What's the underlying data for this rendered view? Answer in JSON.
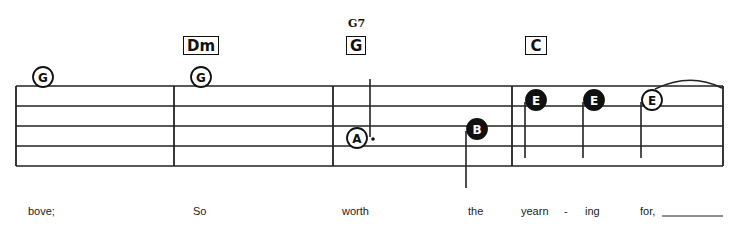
{
  "staff": {
    "line_ys": [
      86,
      106,
      126,
      146,
      166
    ],
    "x_start": 16,
    "x_end": 723,
    "barlines": [
      16,
      174,
      333,
      512,
      723
    ]
  },
  "chords": [
    {
      "label": "Dm",
      "x": 183,
      "y": 36,
      "w": 36
    },
    {
      "label": "G",
      "x": 346,
      "y": 36,
      "w": 20,
      "alt": "G7"
    },
    {
      "label": "C",
      "x": 525,
      "y": 36,
      "w": 22
    }
  ],
  "notes": [
    {
      "letter": "G",
      "cx": 43,
      "cy": 77,
      "filled": false
    },
    {
      "letter": "G",
      "cx": 201,
      "cy": 77,
      "filled": false
    },
    {
      "letter": "A",
      "cx": 357,
      "cy": 138,
      "filled": false,
      "dotted": true
    },
    {
      "letter": "B",
      "cx": 477,
      "cy": 129,
      "filled": true
    },
    {
      "letter": "E",
      "cx": 536,
      "cy": 100,
      "filled": true
    },
    {
      "letter": "E",
      "cx": 594,
      "cy": 100,
      "filled": true
    },
    {
      "letter": "E",
      "cx": 652,
      "cy": 100,
      "filled": false
    }
  ],
  "lyrics": [
    {
      "text": "bove;",
      "x": 28
    },
    {
      "text": "So",
      "x": 193
    },
    {
      "text": "worth",
      "x": 342
    },
    {
      "text": "the",
      "x": 468
    },
    {
      "text": "yearn",
      "x": 521
    },
    {
      "text": "-",
      "x": 564
    },
    {
      "text": "ing",
      "x": 585
    },
    {
      "text": "for,",
      "x": 640
    }
  ]
}
